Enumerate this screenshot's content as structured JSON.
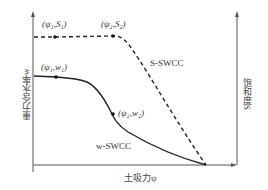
{
  "diagram": {
    "x_axis_label": "土吸力ψ",
    "left_axis_label": "重力含水率w",
    "right_axis_label": "饱和度S",
    "curves": [
      {
        "name": "S-SWCC",
        "style": "dashed",
        "points_labels": [
          "(ψ₁,S₁)",
          "(ψ₂,S₂)"
        ]
      },
      {
        "name": "w-SWCC",
        "style": "solid",
        "points_labels": [
          "(ψ₁,w₁)",
          "(ψ₂,w₂)"
        ]
      }
    ],
    "labels": {
      "s_point1": "(ψ₁,S₁)",
      "s_point2": "(ψ₂,S₂)",
      "w_point1": "(ψ₁,w₁)",
      "w_point2": "(ψ₂,w₂)",
      "s_curve": "S-SWCC",
      "w_curve": "w-SWCC"
    },
    "colors": {
      "line": "#222222",
      "axis": "#555555"
    }
  }
}
